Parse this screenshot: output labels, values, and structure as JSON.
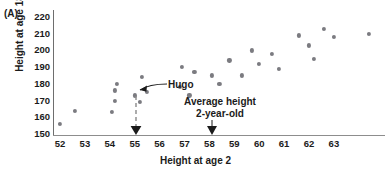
{
  "figure": {
    "panel_label": "(A)",
    "xlabel": "Height at age 2",
    "ylabel": "Height at age 18"
  },
  "annotations": {
    "hugo_label": "Hugo",
    "average_line1": "Average height",
    "average_line2": "2-year-old"
  },
  "chart_data": {
    "type": "scatter",
    "title": "",
    "xlabel": "Height at age 2",
    "ylabel": "Height at age 18",
    "xlim": [
      51.4,
      64.8
    ],
    "ylim": [
      148,
      222
    ],
    "xticks": [
      52,
      53,
      54,
      55,
      56,
      57,
      58,
      59,
      60,
      61,
      62,
      63
    ],
    "yticks": [
      150,
      160,
      170,
      180,
      190,
      200,
      210,
      220
    ],
    "grid": false,
    "legend": null,
    "marker_color": "#7b7b80",
    "points": [
      {
        "x": 52.0,
        "y": 156
      },
      {
        "x": 52.6,
        "y": 164
      },
      {
        "x": 54.1,
        "y": 163
      },
      {
        "x": 54.2,
        "y": 170
      },
      {
        "x": 54.2,
        "y": 176
      },
      {
        "x": 54.3,
        "y": 180
      },
      {
        "x": 55.0,
        "y": 173,
        "label": "Hugo"
      },
      {
        "x": 55.2,
        "y": 169
      },
      {
        "x": 55.3,
        "y": 184
      },
      {
        "x": 55.5,
        "y": 175
      },
      {
        "x": 56.8,
        "y": 178
      },
      {
        "x": 56.9,
        "y": 190
      },
      {
        "x": 57.2,
        "y": 173
      },
      {
        "x": 57.4,
        "y": 187
      },
      {
        "x": 58.1,
        "y": 185
      },
      {
        "x": 58.4,
        "y": 180
      },
      {
        "x": 58.8,
        "y": 194
      },
      {
        "x": 59.3,
        "y": 185
      },
      {
        "x": 59.7,
        "y": 200
      },
      {
        "x": 60.0,
        "y": 192
      },
      {
        "x": 60.5,
        "y": 198
      },
      {
        "x": 60.8,
        "y": 189
      },
      {
        "x": 61.6,
        "y": 209
      },
      {
        "x": 62.0,
        "y": 203
      },
      {
        "x": 62.2,
        "y": 195
      },
      {
        "x": 62.6,
        "y": 213
      },
      {
        "x": 63.0,
        "y": 208
      },
      {
        "x": 64.4,
        "y": 210
      }
    ],
    "annotations": [
      {
        "type": "point-callout",
        "text": "Hugo",
        "x": 55.0,
        "y": 173
      },
      {
        "type": "axis-arrow",
        "text": "Average height 2-year-old",
        "x": 58
      },
      {
        "type": "dashed-drop",
        "text": "",
        "x": 55,
        "y_from": 173,
        "y_to": 150
      }
    ]
  }
}
